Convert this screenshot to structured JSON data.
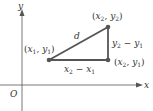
{
  "diagram": {
    "type": "distance-formula",
    "axes": {
      "x_label": "x",
      "y_label": "y",
      "origin_label": "O"
    },
    "points": [
      {
        "name": "p1",
        "label_var": "x",
        "label_sub1": "1",
        "label_var2": "y",
        "label_sub2": "1"
      },
      {
        "name": "p2",
        "label_var": "x",
        "label_sub1": "2",
        "label_var2": "y",
        "label_sub2": "2"
      },
      {
        "name": "p3",
        "label_var": "x",
        "label_sub1": "2",
        "label_var2": "y",
        "label_sub2": "1"
      }
    ],
    "hypotenuse_label": "d",
    "horizontal_label": {
      "a": "x",
      "a_sub": "2",
      "op": "−",
      "b": "x",
      "b_sub": "1"
    },
    "vertical_label": {
      "a": "y",
      "a_sub": "2",
      "op": "−",
      "b": "y",
      "b_sub": "1"
    },
    "colors": {
      "axis": "#555555",
      "triangle": "#555555",
      "text": "#333333"
    }
  }
}
